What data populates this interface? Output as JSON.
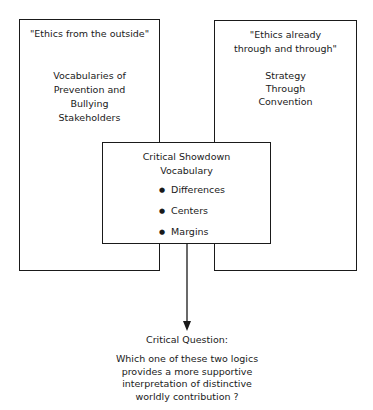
{
  "left_box": {
    "heading": "\"Ethics from the outside\"",
    "body_lines": [
      "Vocabularies of",
      "Prevention and",
      "Bullying",
      "Stakeholders"
    ]
  },
  "right_box": {
    "heading_lines": [
      "\"Ethics already",
      "through and through\""
    ],
    "body_lines": [
      "Strategy",
      "Through",
      "Convention"
    ]
  },
  "center_box": {
    "title_lines": [
      "Critical Showdown",
      "Vocabulary"
    ],
    "bullets": [
      "Differences",
      "Centers",
      "Margins"
    ]
  },
  "question": {
    "label": "Critical Question:",
    "lines": [
      "Which one of these two logics",
      "provides a more supportive",
      "interpretation of distinctive",
      "worldly contribution ?"
    ]
  }
}
